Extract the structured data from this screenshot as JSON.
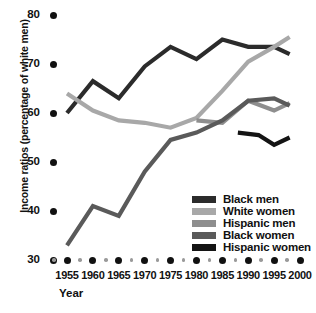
{
  "chart_data": {
    "type": "line",
    "title": "",
    "xlabel": "Year",
    "ylabel": "Income ratios (percentage of white men)",
    "xlim": [
      1955,
      2000
    ],
    "ylim": [
      30,
      80
    ],
    "yticks": [
      30,
      40,
      50,
      60,
      70,
      80
    ],
    "xticks": [
      1955,
      1960,
      1965,
      1970,
      1975,
      1980,
      1985,
      1990,
      1995,
      2000
    ],
    "grid": false,
    "legend_position": "inside-lower-right",
    "series": [
      {
        "name": "Black men",
        "color": "#2b2b2b",
        "x": [
          1955,
          1960,
          1965,
          1970,
          1975,
          1980,
          1985,
          1990,
          1995,
          1998
        ],
        "values": [
          60.0,
          66.5,
          63.0,
          69.5,
          73.5,
          71.0,
          75.0,
          73.5,
          73.5,
          72.0
        ]
      },
      {
        "name": "White women",
        "color": "#a8a8a8",
        "x": [
          1955,
          1960,
          1965,
          1970,
          1975,
          1980,
          1985,
          1990,
          1995,
          1998
        ],
        "values": [
          64.0,
          60.5,
          58.5,
          58.0,
          57.0,
          59.0,
          64.5,
          70.5,
          73.5,
          75.5
        ]
      },
      {
        "name": "Hispanic men",
        "color": "#8e8e8e",
        "x": [
          1980,
          1985,
          1990,
          1995,
          1998
        ],
        "values": [
          58.5,
          58.0,
          62.5,
          60.5,
          62.0
        ]
      },
      {
        "name": "Black women",
        "color": "#5a5a5a",
        "x": [
          1955,
          1960,
          1965,
          1970,
          1975,
          1980,
          1985,
          1990,
          1995,
          1998
        ],
        "values": [
          33.0,
          41.0,
          39.0,
          48.0,
          54.5,
          56.0,
          58.5,
          62.5,
          63.0,
          61.5
        ]
      },
      {
        "name": "Hispanic women",
        "color": "#141414",
        "x": [
          1988,
          1992,
          1995,
          1998
        ],
        "values": [
          56.0,
          55.5,
          53.5,
          55.0
        ]
      }
    ]
  },
  "legend": {
    "items": [
      {
        "label": "Black men",
        "color": "#2b2b2b"
      },
      {
        "label": "White women",
        "color": "#a8a8a8"
      },
      {
        "label": "Hispanic men",
        "color": "#8e8e8e"
      },
      {
        "label": "Black women",
        "color": "#5a5a5a"
      },
      {
        "label": "Hispanic women",
        "color": "#141414"
      }
    ]
  }
}
